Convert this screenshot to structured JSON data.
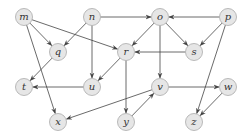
{
  "diagram": {
    "type": "directed-graph",
    "colors": {
      "node_fill": "#e6e6e6",
      "node_stroke": "#aaaaaa",
      "edge": "#444444",
      "label": "#333333"
    },
    "nodes": [
      {
        "id": "m",
        "label": "m",
        "x": 24,
        "y": 17
      },
      {
        "id": "n",
        "label": "n",
        "x": 92,
        "y": 17
      },
      {
        "id": "o",
        "label": "o",
        "x": 160,
        "y": 17
      },
      {
        "id": "p",
        "label": "p",
        "x": 228,
        "y": 17
      },
      {
        "id": "q",
        "label": "q",
        "x": 58,
        "y": 52
      },
      {
        "id": "r",
        "label": "r",
        "x": 126,
        "y": 52
      },
      {
        "id": "s",
        "label": "s",
        "x": 194,
        "y": 52
      },
      {
        "id": "t",
        "label": "t",
        "x": 24,
        "y": 87
      },
      {
        "id": "u",
        "label": "u",
        "x": 92,
        "y": 87
      },
      {
        "id": "v",
        "label": "v",
        "x": 160,
        "y": 87
      },
      {
        "id": "w",
        "label": "w",
        "x": 228,
        "y": 87
      },
      {
        "id": "x",
        "label": "x",
        "x": 58,
        "y": 122
      },
      {
        "id": "y",
        "label": "y",
        "x": 126,
        "y": 122
      },
      {
        "id": "z",
        "label": "z",
        "x": 194,
        "y": 122
      }
    ],
    "edges": [
      {
        "from": "m",
        "to": "q"
      },
      {
        "from": "m",
        "to": "r"
      },
      {
        "from": "m",
        "to": "x"
      },
      {
        "from": "n",
        "to": "q"
      },
      {
        "from": "n",
        "to": "u"
      },
      {
        "from": "n",
        "to": "o"
      },
      {
        "from": "o",
        "to": "r"
      },
      {
        "from": "o",
        "to": "s"
      },
      {
        "from": "o",
        "to": "v"
      },
      {
        "from": "p",
        "to": "o"
      },
      {
        "from": "p",
        "to": "s"
      },
      {
        "from": "p",
        "to": "z"
      },
      {
        "from": "q",
        "to": "t"
      },
      {
        "from": "r",
        "to": "u"
      },
      {
        "from": "r",
        "to": "y"
      },
      {
        "from": "s",
        "to": "r"
      },
      {
        "from": "u",
        "to": "t"
      },
      {
        "from": "v",
        "to": "x"
      },
      {
        "from": "v",
        "to": "w"
      },
      {
        "from": "y",
        "to": "v"
      },
      {
        "from": "w",
        "to": "z"
      }
    ]
  }
}
